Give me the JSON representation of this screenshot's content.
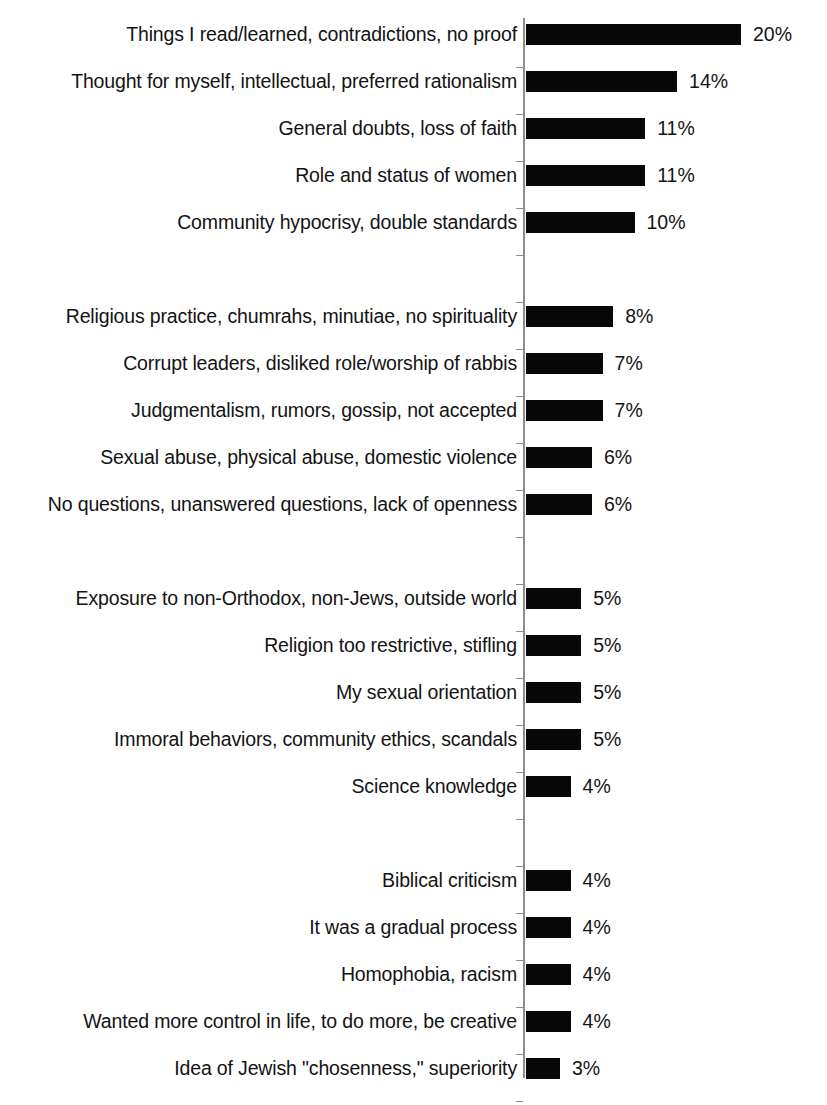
{
  "chart_data": {
    "type": "bar",
    "orientation": "horizontal",
    "title": "",
    "subtitle": "",
    "xlabel": "",
    "ylabel": "",
    "xlim": [
      0,
      20
    ],
    "grid": false,
    "legend": null,
    "value_suffix": "%",
    "categories": [
      "Things I read/learned, contradictions, no proof",
      "Thought for myself, intellectual, preferred rationalism",
      "General doubts, loss of faith",
      "Role and status of women",
      "Community hypocrisy, double standards",
      "Religious practice, chumrahs, minutiae, no spirituality",
      "Corrupt leaders, disliked role/worship of rabbis",
      "Judgmentalism, rumors, gossip, not accepted",
      "Sexual abuse, physical abuse, domestic violence",
      "No questions, unanswered questions, lack of openness",
      "Exposure to non-Orthodox, non-Jews, outside world",
      "Religion too restrictive, stifling",
      "My sexual orientation",
      "Immoral behaviors, community ethics, scandals",
      "Science knowledge",
      "Biblical criticism",
      "It was a gradual process",
      "Homophobia, racism",
      "Wanted more control in life, to do more, be creative",
      "Idea of Jewish \"chosenness,\" superiority"
    ],
    "values": [
      20,
      14,
      11,
      11,
      10,
      8,
      7,
      7,
      6,
      6,
      5,
      5,
      5,
      5,
      4,
      4,
      4,
      4,
      4,
      3
    ],
    "value_labels": [
      "20%",
      "14%",
      "11%",
      "11%",
      "10%",
      "8%",
      "7%",
      "7%",
      "6%",
      "6%",
      "5%",
      "5%",
      "5%",
      "5%",
      "4%",
      "4%",
      "4%",
      "4%",
      "4%",
      "3%"
    ],
    "groups": [
      {
        "label": "",
        "indices": [
          0,
          1,
          2,
          3,
          4
        ]
      },
      {
        "label": "",
        "indices": [
          5,
          6,
          7,
          8,
          9
        ]
      },
      {
        "label": "",
        "indices": [
          10,
          11,
          12,
          13,
          14
        ]
      },
      {
        "label": "",
        "indices": [
          15,
          16,
          17,
          18,
          19
        ]
      }
    ],
    "colors": {
      "bar": "#080808",
      "background": "#ffffff",
      "text": "#131313",
      "axis": "#8d8d8d"
    }
  },
  "layout": {
    "axis_x": 523,
    "bar_start_x": 526,
    "label_right_edge_x": 517,
    "value_gap_px": 12,
    "px_per_percent": 10.65,
    "bar_base_offset_px": 2,
    "row_pitch_px": 47,
    "bar_height_px": 21,
    "first_row_top_y": 24,
    "group_blank_rows": 1,
    "axis_top_y": 18,
    "axis_bottom_y": 1078
  }
}
